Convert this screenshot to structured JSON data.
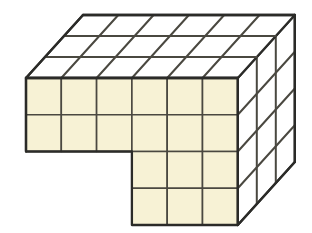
{
  "figure": {
    "title": "Isometric cube stack solid",
    "type": "isometric-cube-stack",
    "background_color": "#FFFFFF"
  },
  "geometry": {
    "origin": {
      "x": 26,
      "y": 78
    },
    "cell_width": 35.3,
    "cell_height": 36.75,
    "depth_step": {
      "dx": 19.0,
      "dy": -21.0
    },
    "columns": 6,
    "rows": 4,
    "depth": 3,
    "notch": {
      "description": "rectangular cut-out in lower-left of front face",
      "col_start": 0,
      "col_end": 3,
      "row_start": 2,
      "row_end": 4
    }
  },
  "colors": {
    "front_fill": "#F7F2D5",
    "top_fill": "#FFFFFF",
    "right_fill": "#FFFFFF",
    "outline": "#2B2B28",
    "grid_line": "#4A4840",
    "background": "#FFFFFF"
  },
  "strokes": {
    "outline_width": 2.3,
    "grid_width": 2.0,
    "inner_width": 1.6
  },
  "faces": [
    {
      "name": "front-face",
      "fill_key": "front_fill",
      "cells": 18,
      "label": "Front face (cream)"
    },
    {
      "name": "top-face",
      "fill_key": "top_fill",
      "cells": 18,
      "label": "Top face (white)"
    },
    {
      "name": "right-face",
      "fill_key": "right_fill",
      "cells": 12,
      "label": "Right face (white)"
    }
  ],
  "counts": {
    "front_visible_squares": 18,
    "top_visible_squares": 18,
    "right_visible_squares": 12
  }
}
